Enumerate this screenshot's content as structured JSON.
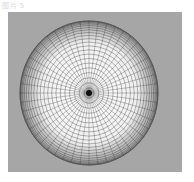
{
  "figure": {
    "caption": "图片 5",
    "background_color": "#a6a6a6",
    "sphere": {
      "center": [
        89,
        93
      ],
      "radius_x": 69,
      "radius_y": 72,
      "latitude_rings": 22,
      "longitude_lines": 48,
      "fill_color": "#ffffff",
      "line_color": "#333333"
    }
  }
}
